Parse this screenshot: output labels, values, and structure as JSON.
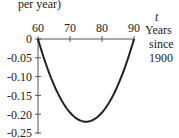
{
  "chart_data": {
    "type": "line",
    "title": "",
    "ylabel_fragment": "per year)",
    "xlabel": {
      "var": "t",
      "line1": "Years",
      "line2": "since",
      "line3": "1900"
    },
    "x_ticks": [
      "60",
      "70",
      "80",
      "90"
    ],
    "y_ticks": [
      "0",
      "-0.05",
      "-0.10",
      "-0.15",
      "-0.20",
      "-0.25"
    ],
    "xlim": [
      60,
      90
    ],
    "ylim": [
      -0.25,
      0
    ],
    "grid": false,
    "legend": null,
    "series": [
      {
        "name": "rate of change",
        "x": [
          60,
          62,
          64,
          66,
          68,
          70,
          72,
          74,
          75,
          76,
          78,
          80,
          82,
          84,
          86,
          88,
          90
        ],
        "y": [
          0,
          -0.057,
          -0.104,
          -0.141,
          -0.17,
          -0.191,
          -0.211,
          -0.219,
          -0.22,
          -0.219,
          -0.211,
          -0.196,
          -0.172,
          -0.141,
          -0.103,
          -0.055,
          0
        ]
      }
    ],
    "color": "#222222"
  }
}
